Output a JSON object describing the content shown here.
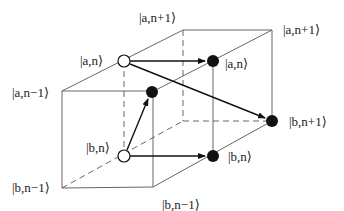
{
  "diagram": {
    "colors": {
      "line": "#555555",
      "arrow": "#111111",
      "open_node_fill": "#ffffff",
      "filled_node_fill": "#111111"
    },
    "labels": {
      "a_n_plus_1_top": "|a,n+1⟩",
      "a_n_plus_1_right": "|a,n+1⟩",
      "a_n_open": "|a,n⟩",
      "a_n_filled": "|a,n⟩",
      "a_n_minus_1": "|a,n−1⟩",
      "b_n_open": "|b,n⟩",
      "b_n_filled": "|b,n⟩",
      "b_n_plus_1": "|b,n+1⟩",
      "b_n_minus_1_left": "|b,n−1⟩",
      "b_n_minus_1_bottom": "|b,n−1⟩"
    },
    "nodes": [
      {
        "id": "a_n_open",
        "type": "open",
        "x": 124,
        "y": 61
      },
      {
        "id": "b_n_open",
        "type": "open",
        "x": 124,
        "y": 156
      },
      {
        "id": "a_n_filled",
        "type": "filled",
        "x": 213,
        "y": 61
      },
      {
        "id": "b_n_filled",
        "type": "filled",
        "x": 213,
        "y": 156
      },
      {
        "id": "front_corner_filled",
        "type": "filled",
        "x": 152,
        "y": 92
      },
      {
        "id": "b_n_plus_1_filled",
        "type": "filled",
        "x": 272,
        "y": 121
      }
    ],
    "arrows": [
      {
        "from": "a_n_open",
        "to": "a_n_filled"
      },
      {
        "from": "a_n_open",
        "to": "b_n_plus_1_filled"
      },
      {
        "from": "b_n_open",
        "to": "front_corner_filled"
      },
      {
        "from": "b_n_open",
        "to": "b_n_filled"
      }
    ]
  }
}
